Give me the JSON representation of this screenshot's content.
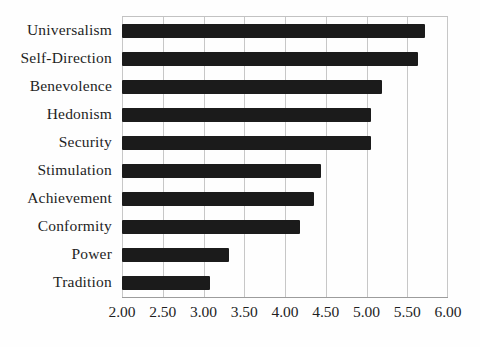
{
  "chart_data": {
    "type": "bar",
    "orientation": "horizontal",
    "title": "",
    "xlabel": "",
    "ylabel": "",
    "categories": [
      "Universalism",
      "Self-Direction",
      "Benevolence",
      "Hedonism",
      "Security",
      "Stimulation",
      "Achievement",
      "Conformity",
      "Power",
      "Tradition"
    ],
    "values": [
      5.72,
      5.63,
      5.19,
      5.06,
      5.05,
      4.44,
      4.36,
      4.19,
      3.31,
      3.08
    ],
    "xlim": [
      2.0,
      6.0
    ],
    "xtick_labels": [
      "2.00",
      "2.50",
      "3.00",
      "3.50",
      "4.00",
      "4.50",
      "5.00",
      "5.50",
      "6.00"
    ],
    "grid": "vertical-gridlines",
    "legend": "none"
  },
  "colors": {
    "bar": "#1b1b1b",
    "gridline": "#c7c7c7",
    "axis_bottom": "#9c9c9c",
    "plot_border_top": "#c2c2c2",
    "text": "#1f1f1f",
    "background": "#fefefe"
  }
}
